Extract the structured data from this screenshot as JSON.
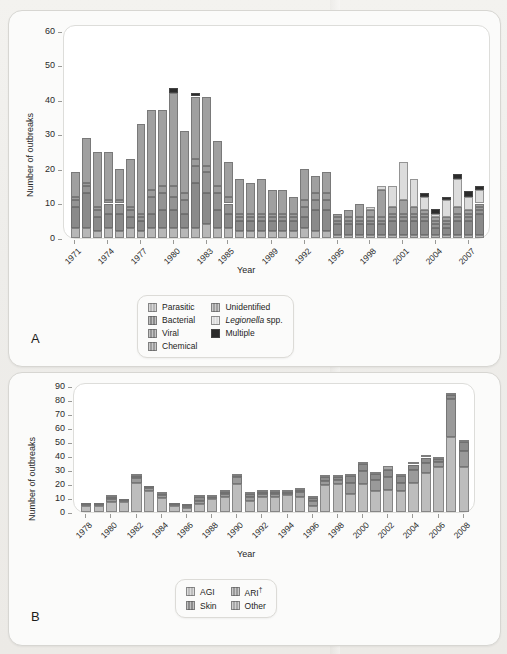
{
  "figure": {
    "background_color": "#efefec",
    "panel_bg": "#fbfbfa",
    "plot_bg": "#ffffff"
  },
  "panelA": {
    "letter": "A",
    "ylabel": "Number of outbreaks",
    "xlabel": "Year",
    "yticks": [
      "0",
      "10",
      "20",
      "30",
      "40",
      "50",
      "60"
    ],
    "xticks": [
      "1971",
      "1974",
      "1977",
      "1980",
      "1983",
      "1985",
      "1989",
      "1992",
      "1995",
      "1998",
      "2001",
      "2004",
      "2007"
    ],
    "legend": [
      {
        "label": "Parasitic",
        "color": "#b7b7b7",
        "style": "plain"
      },
      {
        "label": "Unidentified",
        "color": "#a0a0a0",
        "style": "plain"
      },
      {
        "label": "Bacterial",
        "color": "#8a8a8a",
        "style": "plain"
      },
      {
        "label": "Legionella spp.",
        "color": "#dcdcdc",
        "style": "italic-first"
      },
      {
        "label": "Viral",
        "color": "#949494",
        "style": "plain"
      },
      {
        "label": "Multiple",
        "color": "#2b2b2b",
        "style": "hatch"
      },
      {
        "label": "Chemical",
        "color": "#9c9c9c",
        "style": "plain"
      }
    ]
  },
  "panelB": {
    "letter": "B",
    "ylabel": "Number of outbreaks",
    "xlabel": "Year",
    "yticks": [
      "0",
      "10",
      "20",
      "30",
      "40",
      "50",
      "60",
      "70",
      "80",
      "90"
    ],
    "xticks": [
      "1978",
      "1980",
      "1982",
      "1984",
      "1986",
      "1988",
      "1990",
      "1992",
      "1994",
      "1996",
      "1998",
      "2000",
      "2002",
      "2004",
      "2006",
      "2008"
    ],
    "legend": [
      {
        "label": "AGI",
        "color": "#bdbdbd",
        "style": "plain"
      },
      {
        "label": "ARI",
        "color": "#9a9a9a",
        "style": "dagger"
      },
      {
        "label": "Skin",
        "color": "#8c8c8c",
        "style": "plain"
      },
      {
        "label": "Other",
        "color": "#a8a8a8",
        "style": "plain"
      }
    ]
  },
  "chart_data": [
    {
      "type": "bar",
      "stacked": true,
      "panel": "A",
      "title": "",
      "xlabel": "Year",
      "ylabel": "Number of outbreaks",
      "ylim": [
        0,
        62
      ],
      "ytick_values": [
        0,
        10,
        20,
        30,
        40,
        50,
        60
      ],
      "grid": false,
      "legend_position": "below",
      "categories": [
        1971,
        1972,
        1973,
        1974,
        1975,
        1976,
        1977,
        1978,
        1979,
        1980,
        1981,
        1982,
        1983,
        1984,
        1985,
        1986,
        1987,
        1988,
        1989,
        1990,
        1991,
        1992,
        1993,
        1994,
        1995,
        1996,
        1997,
        1998,
        1999,
        2000,
        2001,
        2002,
        2003,
        2004,
        2005,
        2006,
        2007,
        2008
      ],
      "series": [
        {
          "name": "Parasitic",
          "color": "#b7b7b7",
          "values": [
            3,
            3,
            2,
            3,
            2,
            3,
            2,
            3,
            3,
            3,
            3,
            3,
            4,
            3,
            3,
            2,
            2,
            2,
            2,
            2,
            2,
            3,
            2,
            2,
            1,
            1,
            1,
            1,
            1,
            1,
            1,
            1,
            1,
            1,
            1,
            1,
            1,
            1
          ]
        },
        {
          "name": "Bacterial",
          "color": "#8a8a8a",
          "values": [
            6,
            10,
            4,
            4,
            5,
            3,
            3,
            4,
            5,
            5,
            4,
            13,
            9,
            5,
            4,
            3,
            3,
            3,
            3,
            3,
            3,
            3,
            6,
            6,
            3,
            3,
            3,
            3,
            3,
            4,
            4,
            4,
            4,
            2,
            2,
            4,
            4,
            6
          ]
        },
        {
          "name": "Viral",
          "color": "#949494",
          "values": [
            2,
            2,
            2,
            3,
            3,
            2,
            1,
            5,
            5,
            4,
            4,
            5,
            6,
            5,
            3,
            1,
            1,
            1,
            1,
            1,
            1,
            3,
            3,
            3,
            1,
            1,
            1,
            1,
            1,
            1,
            1,
            1,
            1,
            1,
            1,
            1,
            1,
            1
          ]
        },
        {
          "name": "Chemical",
          "color": "#9c9c9c",
          "values": [
            1,
            1,
            1,
            1,
            1,
            1,
            1,
            2,
            2,
            3,
            2,
            2,
            2,
            2,
            2,
            1,
            1,
            1,
            1,
            1,
            1,
            2,
            2,
            2,
            1,
            1,
            1,
            1,
            1,
            1,
            1,
            1,
            1,
            1,
            1,
            1,
            1,
            1
          ]
        },
        {
          "name": "Unidentified",
          "color": "#a0a0a0",
          "values": [
            7,
            13,
            16,
            14,
            9,
            14,
            26,
            23,
            22,
            27,
            18,
            18,
            20,
            13,
            10,
            10,
            9,
            10,
            7,
            7,
            5,
            9,
            5,
            6,
            1,
            2,
            4,
            2,
            8,
            2,
            4,
            2,
            1,
            1,
            1,
            2,
            1,
            1
          ]
        },
        {
          "name": "Legionella spp.",
          "color": "#dcdcdc",
          "values": [
            0,
            0,
            0,
            0,
            0,
            0,
            0,
            0,
            0,
            0,
            0,
            0,
            0,
            0,
            0,
            0,
            0,
            0,
            0,
            0,
            0,
            0,
            0,
            0,
            0,
            0,
            0,
            1,
            1,
            6,
            11,
            8,
            4,
            1,
            5,
            8,
            4,
            4
          ]
        },
        {
          "name": "Multiple",
          "color": "#2b2b2b",
          "values": [
            0,
            0,
            0,
            0,
            0,
            0,
            0,
            0,
            0,
            1.5,
            0,
            1,
            0,
            0,
            0,
            0,
            0,
            0,
            0,
            0,
            0,
            0,
            0,
            0,
            0,
            0,
            0,
            0,
            0,
            0,
            0,
            0,
            1,
            1.5,
            1,
            1.5,
            1.5,
            1
          ]
        }
      ],
      "totals": [
        19,
        29,
        25,
        20,
        23,
        33,
        29,
        27,
        42,
        48,
        45,
        41,
        41,
        24,
        22,
        17,
        16,
        17,
        14,
        13,
        15,
        25,
        20,
        16,
        8,
        9,
        8,
        9,
        15,
        22,
        19,
        16,
        11,
        16,
        18,
        20,
        15,
        15
      ]
    },
    {
      "type": "bar",
      "stacked": true,
      "panel": "B",
      "title": "",
      "xlabel": "Year",
      "ylabel": "Number of outbreaks",
      "ylim": [
        0,
        93
      ],
      "ytick_values": [
        0,
        10,
        20,
        30,
        40,
        50,
        60,
        70,
        80,
        90
      ],
      "grid": false,
      "legend_position": "below",
      "categories": [
        1978,
        1979,
        1980,
        1981,
        1982,
        1983,
        1984,
        1985,
        1986,
        1987,
        1988,
        1989,
        1990,
        1991,
        1992,
        1993,
        1994,
        1995,
        1996,
        1997,
        1998,
        1999,
        2000,
        2001,
        2002,
        2003,
        2004,
        2005,
        2006,
        2007,
        2008
      ],
      "series": [
        {
          "name": "AGI",
          "color": "#bdbdbd",
          "values": [
            4,
            4,
            7,
            7,
            21,
            15,
            10,
            4,
            3,
            6,
            9,
            11,
            20,
            8,
            11,
            11,
            12,
            11,
            4,
            19,
            20,
            13,
            20,
            15,
            16,
            15,
            21,
            28,
            32,
            54,
            32
          ]
        },
        {
          "name": "ARI",
          "color": "#9a9a9a",
          "values": [
            1,
            1,
            2,
            1,
            3,
            2,
            2,
            1,
            1,
            2,
            1,
            2,
            5,
            3,
            2,
            2,
            1,
            3,
            4,
            3,
            3,
            8,
            9,
            8,
            9,
            6,
            9,
            7,
            4,
            27,
            12
          ]
        },
        {
          "name": "Skin",
          "color": "#8c8c8c",
          "values": [
            1,
            1,
            2,
            1,
            2,
            1,
            1,
            1,
            1,
            3,
            1,
            1,
            1,
            2,
            1,
            1,
            1,
            2,
            2,
            3,
            2,
            5,
            5,
            4,
            5,
            5,
            4,
            4,
            2,
            3,
            6
          ]
        },
        {
          "name": "Other",
          "color": "#a8a8a8",
          "values": [
            0,
            0,
            1,
            0,
            1,
            0,
            1,
            0,
            0,
            1,
            1,
            1,
            1,
            1,
            1,
            1,
            1,
            1,
            1,
            1,
            1,
            1,
            1,
            1,
            3,
            1,
            1,
            1,
            1,
            1,
            1
          ]
        }
      ],
      "totals": [
        6,
        6,
        12,
        9,
        27,
        18,
        14,
        6,
        5,
        12,
        12,
        15,
        27,
        14,
        15,
        15,
        15,
        17,
        11,
        26,
        26,
        27,
        35,
        28,
        33,
        27,
        35,
        40,
        39,
        85,
        51
      ]
    }
  ]
}
